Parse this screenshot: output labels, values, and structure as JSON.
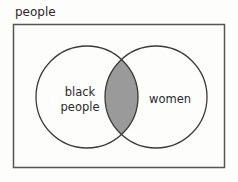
{
  "diagram": {
    "type": "venn",
    "universe_label": "people",
    "sets": [
      {
        "label_line1": "black",
        "label_line2": "people"
      },
      {
        "label": "women"
      }
    ],
    "shaded_region": "intersection",
    "colors": {
      "stroke": "#3a3a3a",
      "frame": "#555555",
      "shade": "#9a9a9a",
      "background": "#fdfdfb"
    }
  }
}
